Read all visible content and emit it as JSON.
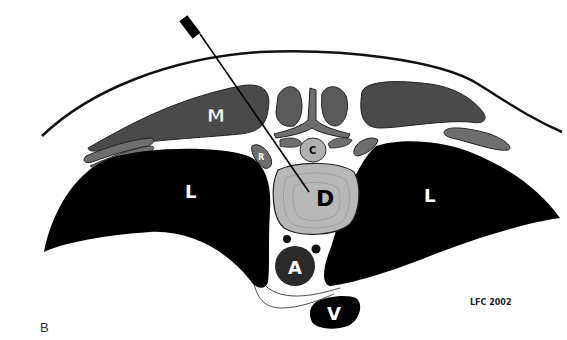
{
  "figure": {
    "panel_letter": "B",
    "credit": "LFC 2002",
    "labels": {
      "muscle": "M",
      "rib": "R",
      "cord": "C",
      "disc": "D",
      "lung_left": "L",
      "lung_right": "L",
      "aorta": "A",
      "vena_cava": "V"
    },
    "colors": {
      "lung": "#000000",
      "muscle": "#4a4a4a",
      "bone": "#6e6e6e",
      "disc": "#b8b8b8",
      "outline": "#111111",
      "aorta": "#2a2a2a"
    }
  }
}
